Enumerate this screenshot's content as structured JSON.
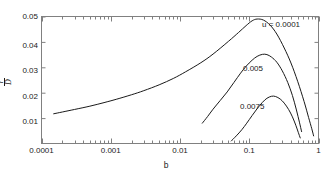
{
  "chart_data": {
    "type": "line",
    "title": "",
    "xlabel": "b",
    "ylabel": "gamma / D-bar",
    "xscale": "log",
    "yscale": "linear",
    "xlim": [
      0.0001,
      1
    ],
    "ylim": [
      0,
      0.05
    ],
    "grid": false,
    "legend_position": "inline-annotations",
    "xticks": [
      "0.0001",
      "0.001",
      "0.01",
      "0.1",
      "1"
    ],
    "xtick_values": [
      0.0001,
      0.001,
      0.01,
      0.1,
      1
    ],
    "yticks": [
      "0.01",
      "0.02",
      "0.03",
      "0.04",
      "0.05"
    ],
    "ytick_values": [
      0.01,
      0.02,
      0.03,
      0.04,
      0.05
    ],
    "series": [
      {
        "name": "u = 0.0001",
        "label": "u = 0.0001",
        "x": [
          0.00015,
          0.0002,
          0.0003,
          0.0005,
          0.0008,
          0.0012,
          0.002,
          0.003,
          0.005,
          0.008,
          0.012,
          0.02,
          0.03,
          0.05,
          0.07,
          0.09,
          0.11,
          0.13,
          0.16,
          0.2,
          0.25,
          0.32,
          0.4,
          0.5,
          0.62,
          0.72,
          0.8,
          0.85
        ],
        "y": [
          0.0117,
          0.0124,
          0.0134,
          0.0147,
          0.0161,
          0.0174,
          0.0192,
          0.0208,
          0.0231,
          0.0256,
          0.0282,
          0.0318,
          0.0352,
          0.0402,
          0.0437,
          0.0464,
          0.0483,
          0.049,
          0.0486,
          0.0466,
          0.0431,
          0.0376,
          0.0317,
          0.0245,
          0.0165,
          0.0102,
          0.0058,
          0.003
        ]
      },
      {
        "name": "0.005",
        "label": "0.005",
        "x": [
          0.021,
          0.025,
          0.03,
          0.038,
          0.048,
          0.06,
          0.075,
          0.09,
          0.11,
          0.13,
          0.155,
          0.18,
          0.21,
          0.25,
          0.3,
          0.36,
          0.42,
          0.48,
          0.53,
          0.57
        ],
        "y": [
          0.008,
          0.0106,
          0.0135,
          0.0169,
          0.0203,
          0.024,
          0.0277,
          0.0304,
          0.0328,
          0.0343,
          0.0351,
          0.035,
          0.034,
          0.032,
          0.0286,
          0.024,
          0.0189,
          0.0132,
          0.0084,
          0.0047
        ]
      },
      {
        "name": "0.0075",
        "label": "0.0075",
        "x": [
          0.055,
          0.065,
          0.078,
          0.092,
          0.11,
          0.13,
          0.155,
          0.18,
          0.21,
          0.24,
          0.28,
          0.32,
          0.37,
          0.42,
          0.47,
          0.51,
          0.545
        ],
        "y": [
          0.001,
          0.003,
          0.0054,
          0.008,
          0.011,
          0.0137,
          0.0162,
          0.0178,
          0.0186,
          0.0185,
          0.0175,
          0.0159,
          0.0134,
          0.0105,
          0.0072,
          0.0044,
          0.0022
        ]
      }
    ],
    "annotations": [
      {
        "text": "u = 0.0001",
        "x_px": 262,
        "y_px": 21
      },
      {
        "text": "0.005",
        "x_px": 243,
        "y_px": 65
      },
      {
        "text": "0.0075",
        "x_px": 240,
        "y_px": 103
      }
    ],
    "style": {
      "line_color": "#1a1a1a",
      "axis_color": "#808080",
      "background": "#ffffff",
      "line_width": 1
    }
  },
  "axes": {
    "x_label": "b",
    "y_label_numerator": "γ",
    "y_label_denominator": "D"
  }
}
